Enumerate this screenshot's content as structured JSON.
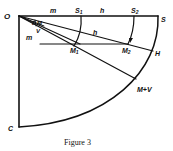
{
  "figure": {
    "caption": "Figure 3",
    "stroke_color": "#111111",
    "background": "#ffffff"
  },
  "points": {
    "O": "O",
    "S": "S",
    "S1": "S",
    "S1_sub": "1",
    "S2": "S",
    "S2_sub": "2",
    "C": "C",
    "H": "H",
    "M1": "M",
    "M1_sub": "1",
    "M2": "M",
    "M2_sub": "2",
    "MV": "M+V"
  },
  "labels": {
    "m_top": "m",
    "h_top": "h",
    "h_mid": "h",
    "E": "E",
    "M": "M",
    "V": "V",
    "m_lower": "m"
  }
}
